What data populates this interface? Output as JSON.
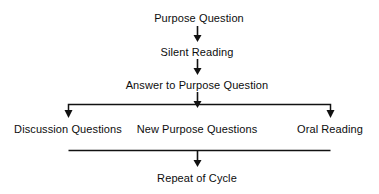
{
  "diagram": {
    "type": "flowchart",
    "line_color": "#111111",
    "text_color": "#0d0d0d",
    "background_color": "#ffffff",
    "nodes": [
      {
        "id": "purpose-question",
        "label": "Purpose Question",
        "x": 199,
        "y": 12
      },
      {
        "id": "silent-reading",
        "label": "Silent Reading",
        "x": 197,
        "y": 46
      },
      {
        "id": "answer-to-purpose-question",
        "label": "Answer to Purpose Question",
        "x": 197,
        "y": 79
      },
      {
        "id": "discussion-questions",
        "label": "Discussion Questions",
        "x": 68,
        "y": 123
      },
      {
        "id": "new-purpose-questions",
        "label": "New Purpose Questions",
        "x": 197,
        "y": 123
      },
      {
        "id": "oral-reading",
        "label": "Oral Reading",
        "x": 330,
        "y": 123
      },
      {
        "id": "repeat-of-cycle",
        "label": "Repeat of Cycle",
        "x": 197,
        "y": 172
      }
    ],
    "connectors": [
      {
        "id": "arrow-purpose-to-silent",
        "from": "purpose-question",
        "to": "silent-reading"
      },
      {
        "id": "arrow-silent-to-answer",
        "from": "silent-reading",
        "to": "answer-to-purpose-question"
      },
      {
        "id": "arrow-answer-to-branch",
        "from": "answer-to-purpose-question",
        "to": "branch-bar"
      },
      {
        "id": "branch-left-arrow",
        "from": "branch-bar",
        "to": "discussion-questions"
      },
      {
        "id": "branch-right-arrow",
        "from": "branch-bar",
        "to": "oral-reading"
      },
      {
        "id": "arrow-merge-to-repeat",
        "from": "merge-bar",
        "to": "repeat-of-cycle"
      }
    ],
    "bars": [
      {
        "id": "branch-bar",
        "x1": 68,
        "x2": 330,
        "y": 104
      },
      {
        "id": "merge-bar",
        "x1": 68,
        "x2": 330,
        "y": 150
      }
    ]
  }
}
